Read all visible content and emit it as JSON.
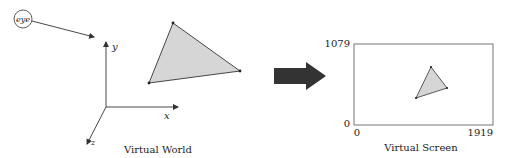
{
  "colors": {
    "stroke": "#333333",
    "triangle_fill": "#d6d6d6",
    "block_arrow": "#333333",
    "screen_border": "#666666"
  },
  "world": {
    "caption": "Virtual World",
    "eye_label": "eye",
    "axes": {
      "x": "x",
      "y": "y",
      "z": "z"
    }
  },
  "transform_arrow": {
    "icon": "right-block-arrow-icon"
  },
  "screen": {
    "caption": "Virtual Screen",
    "y_max_label": "1079",
    "y_min_label": "0",
    "x_min_label": "0",
    "x_max_label": "1919"
  }
}
